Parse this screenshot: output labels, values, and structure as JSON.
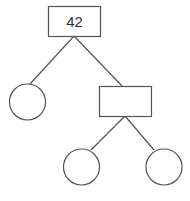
{
  "diagram": {
    "type": "tree",
    "nodes": [
      {
        "id": "root",
        "shape": "rect",
        "label": "42"
      },
      {
        "id": "left-leaf",
        "shape": "circle",
        "label": ""
      },
      {
        "id": "right-internal",
        "shape": "rect",
        "label": ""
      },
      {
        "id": "right-left-leaf",
        "shape": "circle",
        "label": ""
      },
      {
        "id": "right-right-leaf",
        "shape": "circle",
        "label": ""
      }
    ],
    "edges": [
      {
        "from": "root",
        "to": "left-leaf"
      },
      {
        "from": "root",
        "to": "right-internal"
      },
      {
        "from": "right-internal",
        "to": "right-left-leaf"
      },
      {
        "from": "right-internal",
        "to": "right-right-leaf"
      }
    ]
  }
}
